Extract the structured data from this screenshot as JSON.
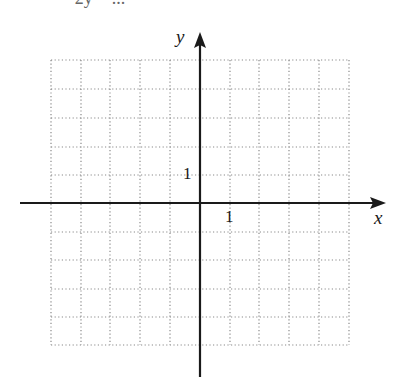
{
  "header": {
    "cropped_text": "= 2y = ... "
  },
  "axes": {
    "x_label": "x",
    "y_label": "y",
    "x_tick_label": "1",
    "y_tick_label": "1"
  },
  "grid": {
    "columns": 10,
    "rows": 10,
    "x_range": [
      -5,
      5
    ],
    "y_range": [
      -5,
      5
    ],
    "style": "dotted",
    "color": "#8a8a8a"
  },
  "colors": {
    "axis": "#1a1a1a",
    "background": "#ffffff"
  }
}
